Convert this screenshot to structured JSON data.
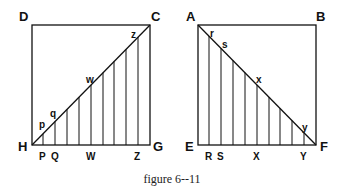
{
  "caption": "figure 6--11",
  "left_figure": {
    "corners": {
      "top_left": "D",
      "top_right": "C",
      "bottom_left": "H",
      "bottom_right": "G"
    },
    "diagonal_points": [
      "p",
      "q",
      "w",
      "z"
    ],
    "base_points": [
      "P",
      "Q",
      "W",
      "Z"
    ],
    "square": {
      "x1": 32,
      "y1": 25,
      "x2": 150,
      "y2": 145
    },
    "verticals_x": [
      43,
      55,
      67,
      79,
      91,
      103,
      114,
      126,
      138
    ]
  },
  "right_figure": {
    "corners": {
      "top_left": "A",
      "top_right": "B",
      "bottom_left": "E",
      "bottom_right": "F"
    },
    "diagonal_points": [
      "r",
      "s",
      "x",
      "y"
    ],
    "base_points": [
      "R",
      "S",
      "X",
      "Y"
    ],
    "square": {
      "x1": 198,
      "y1": 25,
      "x2": 316,
      "y2": 145
    },
    "verticals_x": [
      209,
      221,
      233,
      245,
      257,
      269,
      280,
      292,
      304
    ]
  }
}
